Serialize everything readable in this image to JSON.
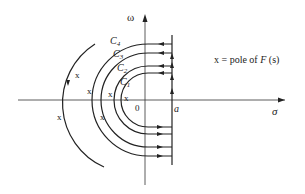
{
  "diagram": {
    "axes": {
      "vertical_label": "ω",
      "horizontal_label": "σ",
      "origin_label": "0",
      "abscissa_label": "a"
    },
    "contours": [
      {
        "name": "C",
        "index": "1"
      },
      {
        "name": "C",
        "index": "2"
      },
      {
        "name": "C",
        "index": "3"
      },
      {
        "name": "C",
        "index": "4"
      }
    ],
    "legend": {
      "symbol": "x",
      "text_prefix": "= pole of ",
      "function": "F",
      "argument": "(s)"
    },
    "pole_marker": "x"
  }
}
